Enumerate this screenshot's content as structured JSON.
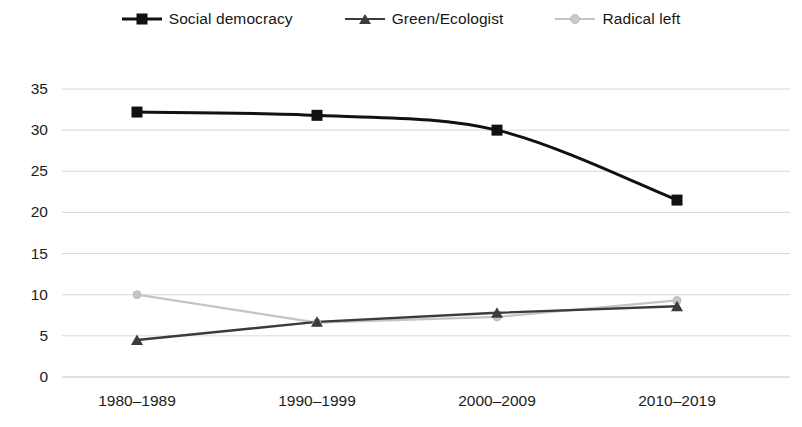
{
  "chart_data": {
    "type": "line",
    "title": "",
    "subtitle": "",
    "xlabel": "",
    "ylabel": "",
    "categories": [
      "1980–1989",
      "1990–1999",
      "2000–2009",
      "2010–2019"
    ],
    "series": [
      {
        "name": "Social democracy",
        "values": [
          32.2,
          31.8,
          30.0,
          21.5
        ],
        "color": "#111111",
        "marker": "square",
        "smooth": true
      },
      {
        "name": "Green/Ecologist",
        "values": [
          4.5,
          6.7,
          7.8,
          8.6
        ],
        "color": "#3b3b3b",
        "marker": "triangle",
        "smooth": false
      },
      {
        "name": "Radical left",
        "values": [
          10.0,
          6.6,
          7.3,
          9.3
        ],
        "color": "#c4c4c4",
        "marker": "circle",
        "smooth": false
      }
    ],
    "yticks": [
      0,
      5,
      10,
      15,
      20,
      25,
      30,
      35
    ],
    "ylim": [
      0,
      35
    ],
    "grid": true,
    "grid_axis": "y",
    "legend_position": "top",
    "legend": [
      "Social democracy",
      "Green/Ecologist",
      "Radical left"
    ]
  },
  "axis": {
    "tick_0": "0",
    "tick_5": "5",
    "tick_10": "10",
    "tick_15": "15",
    "tick_20": "20",
    "tick_25": "25",
    "tick_30": "30",
    "tick_35": "35"
  },
  "colors": {
    "grid": "#d8d8d8",
    "social_democracy": "#111111",
    "green_ecologist": "#3b3b3b",
    "radical_left": "#c4c4c4",
    "text": "#1c1c1c",
    "background": "#ffffff"
  }
}
